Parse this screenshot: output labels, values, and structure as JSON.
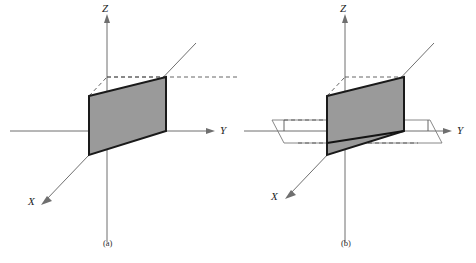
{
  "figure": {
    "panels": [
      {
        "id": "a",
        "caption": "(a)",
        "axes": [
          {
            "name": "Z",
            "label": "Z",
            "direction": "up"
          },
          {
            "name": "Y",
            "label": "Y",
            "direction": "right"
          },
          {
            "name": "X",
            "label": "X",
            "direction": "lower-left"
          }
        ],
        "shapes": {
          "shaded_rectangle": {
            "name": "vertical-plane-patch",
            "fill": "#9a9a9a",
            "stroke": "#1a1a1a"
          },
          "dashed_construction_lines": true,
          "horizontal_plane": false
        }
      },
      {
        "id": "b",
        "caption": "(b)",
        "axes": [
          {
            "name": "Z",
            "label": "Z",
            "direction": "up"
          },
          {
            "name": "Y",
            "label": "Y",
            "direction": "right"
          },
          {
            "name": "X",
            "label": "X",
            "direction": "lower-left"
          }
        ],
        "shapes": {
          "shaded_rectangle": {
            "name": "vertical-plane-patch",
            "fill": "#9a9a9a",
            "stroke": "#1a1a1a"
          },
          "dashed_construction_lines": true,
          "horizontal_plane": true,
          "intersection_line": true,
          "right_angle_ticks": 2
        }
      }
    ],
    "figure_number": "",
    "colors": {
      "axis": "#6f6f6f",
      "dashed": "#555555",
      "patch_fill": "#9a9a9a",
      "patch_stroke": "#1a1a1a",
      "plane_edge": "#7a7a7a",
      "background": "#ffffff"
    }
  }
}
